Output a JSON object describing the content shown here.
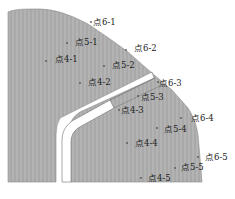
{
  "diagram": {
    "colors": {
      "body": "#a9a9a9",
      "stripe": "#b5b5b5",
      "slot": "#ffffff",
      "outline": "#6e6e6e",
      "text": "#222222",
      "point": "#555555"
    },
    "points": [
      {
        "id": "p6-1",
        "label": "点6-1"
      },
      {
        "id": "p5-1",
        "label": "点5-1"
      },
      {
        "id": "p4-1",
        "label": "点4-1"
      },
      {
        "id": "p6-2",
        "label": "点6-2"
      },
      {
        "id": "p5-2",
        "label": "点5-2"
      },
      {
        "id": "p4-2",
        "label": "点4-2"
      },
      {
        "id": "p6-3",
        "label": "点6-3"
      },
      {
        "id": "p5-3",
        "label": "点5-3"
      },
      {
        "id": "p4-3",
        "label": "点4-3"
      },
      {
        "id": "p6-4",
        "label": "点6-4"
      },
      {
        "id": "p5-4",
        "label": "点5-4"
      },
      {
        "id": "p4-4",
        "label": "点4-4"
      },
      {
        "id": "p6-5",
        "label": "点6-5"
      },
      {
        "id": "p5-5",
        "label": "点5-5"
      },
      {
        "id": "p4-5",
        "label": "点4-5"
      }
    ]
  }
}
